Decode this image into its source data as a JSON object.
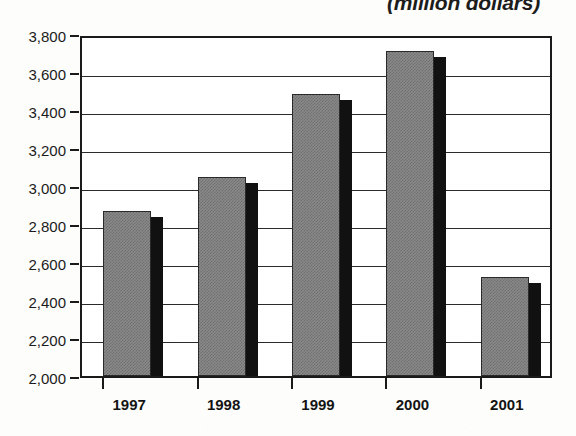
{
  "chart_data": {
    "type": "bar",
    "title": "(million dollars)",
    "xlabel": "",
    "ylabel": "",
    "categories": [
      "1997",
      "1998",
      "1999",
      "2000",
      "2001"
    ],
    "values": [
      2870,
      3045,
      3485,
      3710,
      2520
    ],
    "series": [
      {
        "name": "Amount",
        "values": [
          2870,
          3045,
          3485,
          3710,
          2520
        ]
      }
    ],
    "ylim": [
      2000,
      3800
    ],
    "ytick_values": [
      3800,
      3600,
      3400,
      3200,
      3000,
      2800,
      2600,
      2400,
      2200,
      2000
    ],
    "ytick_labels": [
      "3,800",
      "3,600",
      "3,400",
      "3,200",
      "3,000",
      "2,800",
      "2,600",
      "2,400",
      "2,200",
      "2,000"
    ],
    "grid": true,
    "legend": "none",
    "bar_fill_color": "#8a8a8a",
    "bar_shadow_color": "#111111",
    "axis_color": "#1a1a1a",
    "plot_background": "#ffffff",
    "page_background": "#fdfdfb"
  }
}
